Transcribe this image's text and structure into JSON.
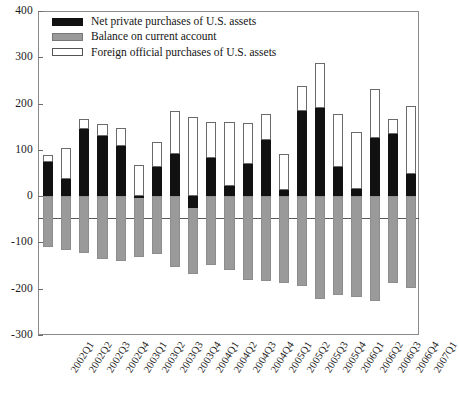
{
  "chart_data": {
    "type": "bar",
    "title": "",
    "subtitle": "",
    "xlabel": "",
    "ylabel": "",
    "ylim": [
      -300,
      400
    ],
    "yticks": [
      400,
      300,
      200,
      100,
      0,
      -100,
      -200,
      -300
    ],
    "ytick_labels": [
      "400",
      "300",
      "200",
      "100",
      "0",
      "-100",
      "-200",
      "-300"
    ],
    "grid": false,
    "stacked": true,
    "legend_position": "top-left",
    "units": "billions of U.S. dollars",
    "categories": [
      "2002Q1",
      "2002Q2",
      "2002Q3",
      "2002Q4",
      "2003Q1",
      "2003Q2",
      "2003Q3",
      "2003Q4",
      "2004Q1",
      "2004Q2",
      "2004Q3",
      "2004Q4",
      "2005Q1",
      "2005Q2",
      "2005Q3",
      "2005Q4",
      "2006Q1",
      "2006Q2",
      "2006Q3",
      "2006Q4",
      "2007Q1"
    ],
    "series": [
      {
        "name": "Net private purchases of U.S. assets",
        "color": "#111111",
        "values": [
          73,
          37,
          146,
          129,
          109,
          -4,
          64,
          90,
          -26,
          83,
          22,
          69,
          121,
          13,
          183,
          190,
          63,
          15,
          126,
          134,
          48
        ]
      },
      {
        "name": "Balance on current account",
        "color": "#9a9a9a",
        "values": [
          -110,
          -117,
          -123,
          -136,
          -141,
          -131,
          -126,
          -153,
          -168,
          -148,
          -160,
          -182,
          -183,
          -188,
          -195,
          -223,
          -213,
          -218,
          -226,
          -188,
          -198
        ]
      },
      {
        "name": "Foreign official purchases of U.S. assets",
        "color": "#ffffff",
        "values": [
          15,
          68,
          20,
          26,
          38,
          68,
          54,
          93,
          171,
          77,
          138,
          90,
          56,
          77,
          55,
          98,
          115,
          123,
          105,
          33,
          146
        ]
      }
    ],
    "series_totals": [
      88,
      105,
      166,
      155,
      147,
      64,
      118,
      183,
      145,
      160,
      160,
      159,
      177,
      90,
      238,
      288,
      178,
      138,
      231,
      167,
      194
    ]
  },
  "legend": {
    "items": [
      {
        "label": "Net private purchases of U.S. assets",
        "swatch": "black-swatch"
      },
      {
        "label": "Balance on current account",
        "swatch": "gray-swatch"
      },
      {
        "label": "Foreign official purchases of U.S. assets",
        "swatch": "white-swatch"
      }
    ]
  }
}
